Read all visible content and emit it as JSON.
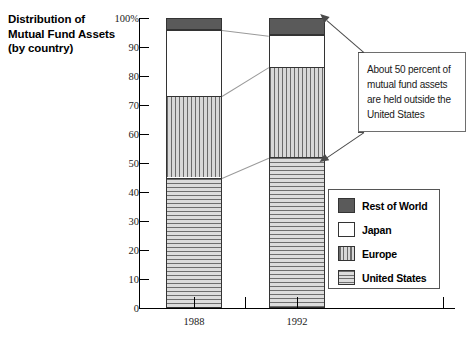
{
  "title": {
    "line1": "Distribution of",
    "line2": "Mutual Fund Assets",
    "line3": "(by country)"
  },
  "annotation": {
    "text": "About 50 percent of mutual fund assets are held outside the United States"
  },
  "legend": {
    "items": [
      {
        "label": "Rest of World",
        "swatch": "solid-dark-gray",
        "color": "#5a5a5a"
      },
      {
        "label": "Japan",
        "swatch": "white",
        "color": "#ffffff"
      },
      {
        "label": "Europe",
        "swatch": "vertical-stripes",
        "color": "#6b6b6b"
      },
      {
        "label": "United States",
        "swatch": "horizontal-stripes",
        "color": "#6e6e6e"
      }
    ]
  },
  "chart_data": {
    "type": "bar",
    "subtype": "stacked-column-100",
    "title": "Distribution of Mutual Fund Assets (by country)",
    "xlabel": "",
    "ylabel": "",
    "ylim": [
      0,
      100
    ],
    "yticks": [
      0,
      10,
      20,
      30,
      40,
      50,
      60,
      70,
      80,
      90,
      100
    ],
    "ytick_labels": [
      "0",
      "10",
      "20",
      "30",
      "40",
      "50",
      "60",
      "70",
      "80",
      "90",
      "100%"
    ],
    "categories": [
      "1988",
      "1992"
    ],
    "grid": false,
    "legend_position": "bottom-right",
    "series": [
      {
        "name": "United States",
        "values": [
          45,
          52
        ]
      },
      {
        "name": "Europe",
        "values": [
          28,
          31
        ]
      },
      {
        "name": "Japan",
        "values": [
          23,
          11
        ]
      },
      {
        "name": "Rest of World",
        "values": [
          4,
          6
        ]
      }
    ],
    "cumulative_tops": {
      "1988": {
        "United States": 45,
        "Europe": 73,
        "Japan": 96,
        "Rest of World": 100
      },
      "1992": {
        "United States": 52,
        "Europe": 83,
        "Japan": 94,
        "Rest of World": 100
      }
    },
    "annotations": [
      {
        "text": "About 50 percent of mutual fund assets are held outside the United States",
        "points_to": [
          "1992 top of bar",
          "1992 United States / Europe boundary"
        ]
      }
    ]
  },
  "axis": {
    "y_top_label": "100%",
    "ticks": [
      "100%",
      "90",
      "80",
      "70",
      "60",
      "50",
      "40",
      "30",
      "20",
      "10",
      "0"
    ]
  }
}
